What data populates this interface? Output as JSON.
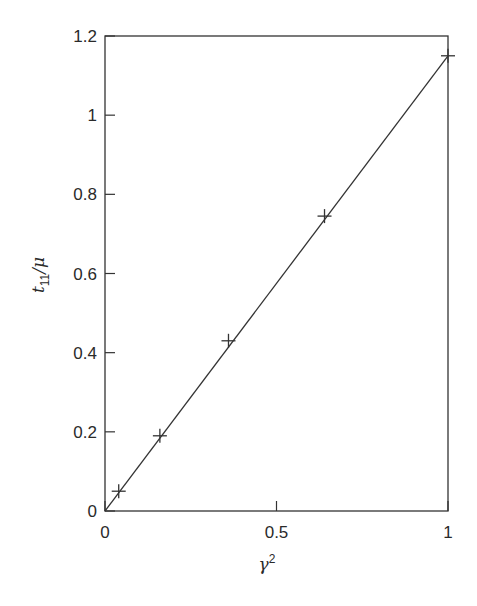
{
  "chart_data": {
    "type": "scatter",
    "title": "",
    "xlabel": "γ²",
    "ylabel": "t₁₁/μ",
    "xlim": [
      0,
      1
    ],
    "ylim": [
      0,
      1.2
    ],
    "grid": false,
    "legend": null,
    "x_ticks": [
      0,
      0.5,
      1
    ],
    "x_tick_labels": [
      "0",
      "0.5",
      "1"
    ],
    "y_ticks": [
      0,
      0.2,
      0.4,
      0.6,
      0.8,
      1,
      1.2
    ],
    "y_tick_labels": [
      "0",
      "0.2",
      "0.4",
      "0.6",
      "0.8",
      "1",
      "1.2"
    ],
    "series": [
      {
        "name": "data",
        "marker": "+",
        "x": [
          0.04,
          0.16,
          0.36,
          0.64,
          1.0
        ],
        "y": [
          0.05,
          0.19,
          0.43,
          0.745,
          1.15
        ]
      },
      {
        "name": "fit",
        "style": "line",
        "x": [
          0,
          1.0
        ],
        "y": [
          0,
          1.15
        ]
      }
    ]
  },
  "labels": {
    "xlabel_base": "γ",
    "xlabel_sup": "2",
    "ylabel_base": "t",
    "ylabel_sub": "11",
    "ylabel_rest": "/μ"
  },
  "colors": {
    "axis": "#333333",
    "line": "#333333",
    "marker": "#333333"
  }
}
